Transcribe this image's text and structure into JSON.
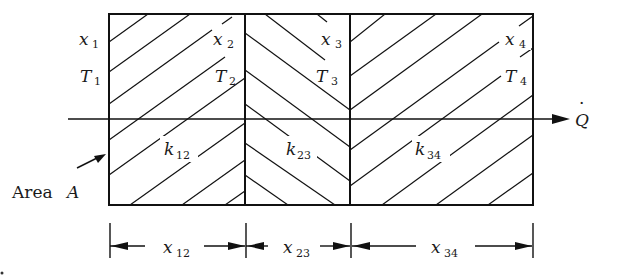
{
  "figure": {
    "layers": [
      {
        "id": "layer-12",
        "conductivity": {
          "base": "k",
          "sub": "12"
        },
        "thickness": {
          "base": "x",
          "sub": "12"
        },
        "hatch": "forward"
      },
      {
        "id": "layer-23",
        "conductivity": {
          "base": "k",
          "sub": "23"
        },
        "thickness": {
          "base": "x",
          "sub": "23"
        },
        "hatch": "backward"
      },
      {
        "id": "layer-34",
        "conductivity": {
          "base": "k",
          "sub": "34"
        },
        "thickness": {
          "base": "x",
          "sub": "34"
        },
        "hatch": "forward"
      }
    ],
    "interfaces": [
      {
        "position": {
          "base": "x",
          "sub": "1"
        },
        "temperature": {
          "base": "T",
          "sub": "1"
        }
      },
      {
        "position": {
          "base": "x",
          "sub": "2"
        },
        "temperature": {
          "base": "T",
          "sub": "2"
        }
      },
      {
        "position": {
          "base": "x",
          "sub": "3"
        },
        "temperature": {
          "base": "T",
          "sub": "3"
        }
      },
      {
        "position": {
          "base": "x",
          "sub": "4"
        },
        "temperature": {
          "base": "T",
          "sub": "4"
        }
      }
    ],
    "heat_flow": {
      "symbol": "Q",
      "dot": "·"
    },
    "area_label": {
      "text": "Area ",
      "symbol": "A"
    }
  }
}
